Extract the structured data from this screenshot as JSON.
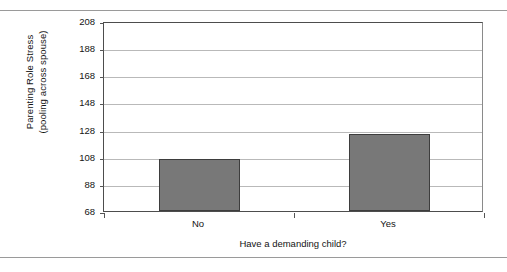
{
  "chart_data": {
    "type": "bar",
    "title": "",
    "subtitle": "",
    "categories": [
      "No",
      "Yes"
    ],
    "values": [
      106,
      125
    ],
    "series": [
      {
        "name": "Parenting Role Stress",
        "values": [
          106,
          125
        ]
      }
    ],
    "xlabel": "Have a demanding child?",
    "ylabel_line1": "Parenting Role Stress",
    "ylabel_line2": "(pooling across spouse)",
    "ylim": [
      68,
      208
    ],
    "ytick_step": 20,
    "yticks": [
      68,
      88,
      108,
      128,
      148,
      168,
      188,
      208
    ],
    "ytick_labels": [
      "68",
      "88",
      "108",
      "128",
      "148",
      "168",
      "188",
      "208"
    ],
    "grid": "horizontal",
    "legend": "none",
    "bar_color": "#787878",
    "bar_edge_color": "#3d3d3d",
    "gridline_color": "#b9b9b9",
    "axis_color": "#4d4d4d",
    "background": "#ffffff"
  }
}
